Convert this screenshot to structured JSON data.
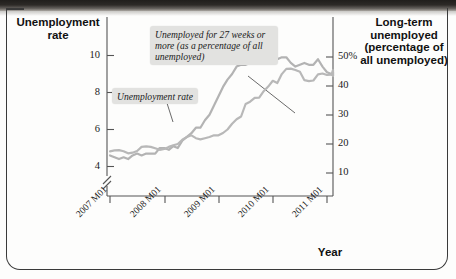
{
  "figure": {
    "left_axis_title": "Unemployment rate",
    "right_axis_title": "Long-term unemployed (percentage of all unemployed)",
    "x_axis_title": "Year"
  },
  "callouts": {
    "long_term": "Unemployed for 27 weeks or more (as a percentage of all unemployed)",
    "unemployment_rate": "Unemployment rate"
  },
  "chart_data": {
    "type": "line",
    "title": "",
    "xlabel": "Year",
    "ylabel": "Unemployment rate",
    "y2label": "Long-term unemployed (percentage of all unemployed)",
    "grid": false,
    "legend": "annotations",
    "axis_break_left": true,
    "xlim_labels": [
      "2007 M01",
      "2008 M01",
      "2009 M01",
      "2010 M01",
      "2011 M01"
    ],
    "x_tick_labels": [
      "2007 M01",
      "2008 M01",
      "2009 M01",
      "2010 M01",
      "2011 M01"
    ],
    "y_tick_labels": [
      "4",
      "6",
      "8",
      "10"
    ],
    "y_ticks": [
      4,
      6,
      8,
      10
    ],
    "ylim": [
      3.0,
      10.8
    ],
    "y2_tick_labels": [
      "10",
      "20",
      "30",
      "40",
      "50%"
    ],
    "y2_ticks": [
      10,
      20,
      30,
      40,
      50
    ],
    "y2lim": [
      5,
      54
    ],
    "line_color": "#b3b3b3",
    "series": [
      {
        "name": "Unemployment rate",
        "axis": "left",
        "units": "percent",
        "x": [
          "2007 M01",
          "2007 M02",
          "2007 M03",
          "2007 M04",
          "2007 M05",
          "2007 M06",
          "2007 M07",
          "2007 M08",
          "2007 M09",
          "2007 M10",
          "2007 M11",
          "2007 M12",
          "2008 M01",
          "2008 M02",
          "2008 M03",
          "2008 M04",
          "2008 M05",
          "2008 M06",
          "2008 M07",
          "2008 M08",
          "2008 M09",
          "2008 M10",
          "2008 M11",
          "2008 M12",
          "2009 M01",
          "2009 M02",
          "2009 M03",
          "2009 M04",
          "2009 M05",
          "2009 M06",
          "2009 M07",
          "2009 M08",
          "2009 M09",
          "2009 M10",
          "2009 M11",
          "2009 M12",
          "2010 M01",
          "2010 M02",
          "2010 M03",
          "2010 M04",
          "2010 M05",
          "2010 M06",
          "2010 M07",
          "2010 M08",
          "2010 M09",
          "2010 M10",
          "2010 M11",
          "2010 M12",
          "2011 M01",
          "2011 M02",
          "2011 M03",
          "2011 M04",
          "2011 M05",
          "2011 M06"
        ],
        "values": [
          4.6,
          4.5,
          4.4,
          4.5,
          4.4,
          4.6,
          4.7,
          4.6,
          4.7,
          4.7,
          4.7,
          5.0,
          5.0,
          4.9,
          5.1,
          5.0,
          5.4,
          5.6,
          5.8,
          6.1,
          6.1,
          6.5,
          6.8,
          7.3,
          7.8,
          8.3,
          8.7,
          9.0,
          9.4,
          9.5,
          9.5,
          9.6,
          9.8,
          10.0,
          9.9,
          9.9,
          9.8,
          9.8,
          9.9,
          9.9,
          9.6,
          9.4,
          9.5,
          9.6,
          9.5,
          9.5,
          9.8,
          9.4,
          9.1,
          9.0,
          8.9,
          9.0,
          9.0,
          9.1
        ]
      },
      {
        "name": "Unemployed for 27 weeks or more (as a percentage of all unemployed)",
        "axis": "right",
        "units": "percent of all unemployed",
        "x": [
          "2007 M01",
          "2007 M02",
          "2007 M03",
          "2007 M04",
          "2007 M05",
          "2007 M06",
          "2007 M07",
          "2007 M08",
          "2007 M09",
          "2007 M10",
          "2007 M11",
          "2007 M12",
          "2008 M01",
          "2008 M02",
          "2008 M03",
          "2008 M04",
          "2008 M05",
          "2008 M06",
          "2008 M07",
          "2008 M08",
          "2008 M09",
          "2008 M10",
          "2008 M11",
          "2008 M12",
          "2009 M01",
          "2009 M02",
          "2009 M03",
          "2009 M04",
          "2009 M05",
          "2009 M06",
          "2009 M07",
          "2009 M08",
          "2009 M09",
          "2009 M10",
          "2009 M11",
          "2009 M12",
          "2010 M01",
          "2010 M02",
          "2010 M03",
          "2010 M04",
          "2010 M05",
          "2010 M06",
          "2010 M07",
          "2010 M08",
          "2010 M09",
          "2010 M10",
          "2010 M11",
          "2010 M12",
          "2011 M01",
          "2011 M02",
          "2011 M03",
          "2011 M04",
          "2011 M05",
          "2011 M06"
        ],
        "values": [
          17.5,
          17.8,
          17.9,
          17.5,
          16.8,
          17.0,
          17.6,
          19.0,
          19.2,
          19.0,
          18.5,
          18.0,
          18.3,
          19.0,
          19.6,
          20.0,
          21.5,
          22.4,
          23.0,
          22.0,
          21.6,
          22.0,
          22.4,
          23.0,
          23.0,
          23.8,
          25.0,
          27.0,
          28.5,
          29.5,
          33.8,
          34.6,
          35.9,
          36.0,
          38.2,
          39.8,
          41.8,
          41.0,
          44.1,
          45.9,
          46.0,
          45.5,
          44.9,
          42.0,
          41.7,
          41.9,
          44.0,
          44.3,
          43.8,
          43.9,
          45.5,
          43.4,
          45.1,
          44.4
        ]
      }
    ]
  }
}
